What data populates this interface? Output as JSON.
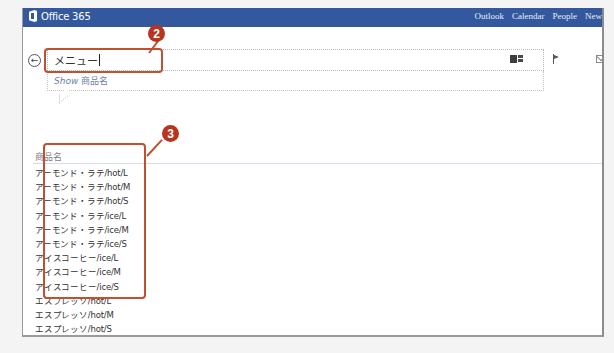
{
  "topbar": {
    "brand": "Office 365",
    "nav": [
      "Outlook",
      "Calendar",
      "People",
      "New"
    ],
    "color": "#34589e"
  },
  "search": {
    "value": "メニュー",
    "suggestion_prefix": "Show",
    "suggestion_value": "商品名"
  },
  "toolbar": {
    "icons": [
      "tile-view-icon",
      "flag-icon",
      "mail-icon"
    ]
  },
  "list": {
    "header": "商品名",
    "items": [
      "アーモンド・ラテ/hot/L",
      "アーモンド・ラテ/hot/M",
      "アーモンド・ラテ/hot/S",
      "アーモンド・ラテ/ice/L",
      "アーモンド・ラテ/ice/M",
      "アーモンド・ラテ/ice/S",
      "アイスコーヒー/ice/L",
      "アイスコーヒー/ice/M",
      "アイスコーヒー/ice/S",
      "エスプレッソ/hot/L",
      "エスプレッソ/hot/M",
      "エスプレッソ/hot/S"
    ]
  },
  "annotations": {
    "badge_2": "2",
    "badge_3": "3",
    "color": "#c0502f"
  }
}
